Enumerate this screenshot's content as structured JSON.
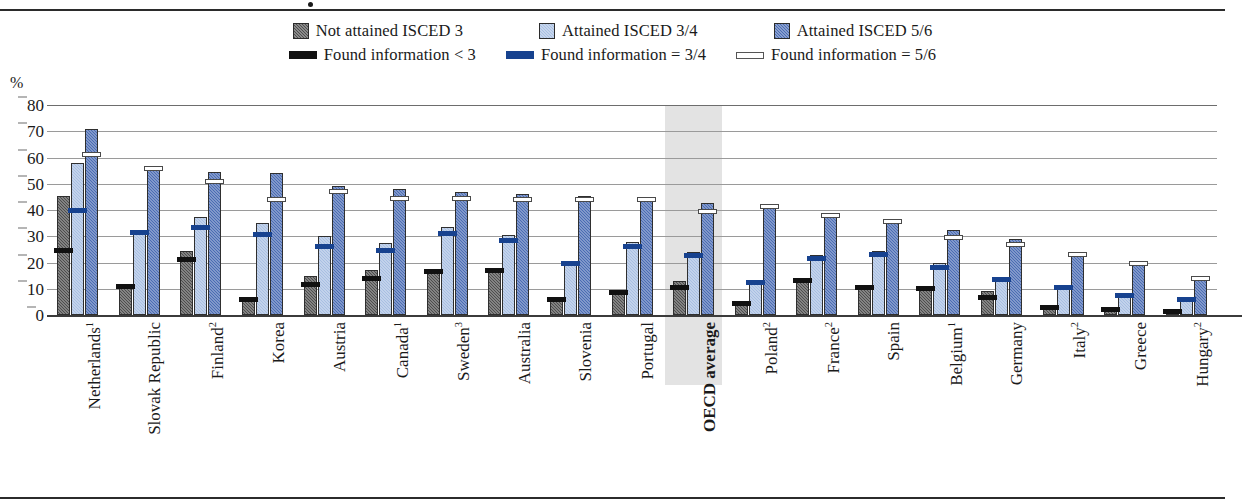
{
  "axis": {
    "unit_label": "%",
    "y_ticks": [
      0,
      10,
      20,
      30,
      40,
      50,
      60,
      70,
      80
    ]
  },
  "legend": {
    "bars": [
      {
        "name": "legend-not-attained-isced-3",
        "label": "Not attained ISCED 3",
        "color": "#4d4d4d"
      },
      {
        "name": "legend-attained-isced-34",
        "label": "Attained ISCED 3/4",
        "color": "#a8bfe2"
      },
      {
        "name": "legend-attained-isced-56",
        "label": "Attained ISCED 5/6",
        "color": "#4a6cb3"
      }
    ],
    "lines": [
      {
        "name": "legend-found-information-lt-3",
        "label": "Found information  < 3",
        "color": "#111111"
      },
      {
        "name": "legend-found-information-34",
        "label": "Found information = 3/4",
        "color": "#17428f"
      },
      {
        "name": "legend-found-information-56",
        "label": "Found information = 5/6",
        "color": "#ffffff"
      }
    ]
  },
  "chart_data": {
    "type": "bar",
    "title": "",
    "xlabel": "",
    "ylabel": "%",
    "ylim": [
      0,
      80
    ],
    "grid": true,
    "legend_position": "top",
    "highlight_category": "OECD average",
    "categories": [
      "Netherlands",
      "Slovak Republic",
      "Finland",
      "Korea",
      "Austria",
      "Canada",
      "Sweden",
      "Australia",
      "Slovenia",
      "Portugal",
      "OECD average",
      "Poland",
      "France",
      "Spain",
      "Belgium",
      "Germany",
      "Italy",
      "Greece",
      "Hungary"
    ],
    "category_notes": [
      "1",
      "",
      "2",
      "",
      "",
      "1",
      "3",
      "",
      "",
      "",
      "",
      "2",
      "2",
      "",
      "1",
      "",
      "2",
      "",
      "2"
    ],
    "series": [
      {
        "name": "Not attained ISCED 3",
        "color": "#4d4d4d",
        "values": [
          45.5,
          11.0,
          24.5,
          6.5,
          15.0,
          17.0,
          16.5,
          18.0,
          6.5,
          9.0,
          13.0,
          4.5,
          14.0,
          11.0,
          11.0,
          9.0,
          3.5,
          2.0,
          2.0
        ]
      },
      {
        "name": "Attained ISCED 3/4",
        "color": "#a8bfe2",
        "values": [
          58.0,
          32.0,
          37.5,
          35.0,
          30.0,
          27.5,
          33.5,
          30.5,
          20.5,
          28.0,
          24.0,
          12.5,
          23.0,
          24.5,
          20.0,
          14.5,
          11.0,
          8.0,
          6.5
        ]
      },
      {
        "name": "Attained ISCED 5/6",
        "color": "#4a6cb3",
        "values": [
          71.0,
          56.5,
          54.5,
          54.0,
          49.0,
          48.0,
          47.0,
          46.0,
          45.5,
          45.0,
          42.5,
          41.0,
          38.5,
          36.0,
          32.5,
          29.0,
          23.5,
          19.5,
          15.0
        ]
      }
    ],
    "markers": [
      {
        "name": "Found information  < 3",
        "color": "#111111",
        "values": [
          24.5,
          11.0,
          21.0,
          6.0,
          11.5,
          14.0,
          16.5,
          17.0,
          6.0,
          8.5,
          10.5,
          4.5,
          13.0,
          10.5,
          10.0,
          6.5,
          3.0,
          2.0,
          1.5
        ]
      },
      {
        "name": "Found information = 3/4",
        "color": "#17428f",
        "values": [
          40.0,
          31.5,
          33.5,
          30.5,
          26.0,
          24.5,
          31.0,
          28.5,
          19.5,
          26.0,
          22.5,
          12.5,
          21.5,
          23.0,
          18.0,
          13.5,
          10.5,
          7.5,
          6.0
        ]
      },
      {
        "name": "Found information = 5/6",
        "color": "#ffffff",
        "values": [
          61.0,
          56.0,
          51.0,
          44.0,
          47.0,
          44.5,
          44.5,
          44.0,
          44.0,
          44.0,
          39.5,
          41.5,
          38.0,
          35.5,
          29.5,
          27.0,
          23.0,
          19.5,
          14.0
        ]
      }
    ]
  }
}
